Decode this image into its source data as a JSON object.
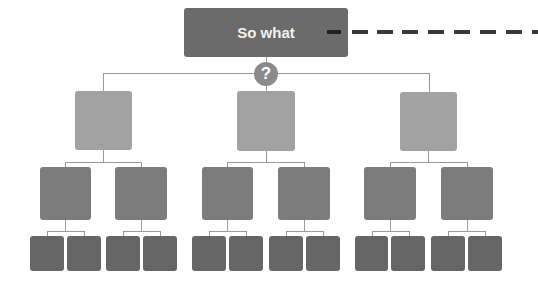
{
  "diagram": {
    "type": "issue-tree",
    "root": {
      "label": "So what"
    },
    "connector_icon": {
      "name": "question-icon",
      "glyph": "?"
    },
    "colors": {
      "root": "#6b6b6b",
      "level1": "#a2a2a2",
      "level2": "#7c7c7c",
      "level3": "#666666",
      "line": "#9a9a9a",
      "dash": "#3a3a3a"
    },
    "levels": {
      "level1_count": 3,
      "level2_per_parent": 2,
      "level3_per_parent": 2
    },
    "dashed_line": {
      "direction": "right",
      "from": "root"
    }
  }
}
